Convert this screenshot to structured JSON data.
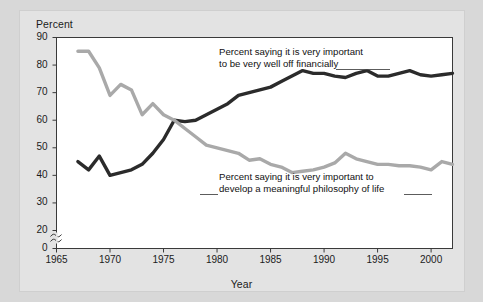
{
  "chart_data": {
    "type": "line",
    "title": "",
    "xlabel": "Year",
    "ylabel": "Percent",
    "xlim": [
      1965,
      2002
    ],
    "ylim": [
      0,
      90
    ],
    "y_axis_break": true,
    "y_break_symbol": "~",
    "grid": true,
    "grid_axis": "y",
    "legend_position": "inline-annotations",
    "x_ticks": [
      1965,
      1970,
      1975,
      1980,
      1985,
      1990,
      1995,
      2000
    ],
    "x_tick_labels": [
      "1965",
      "1970",
      "1975",
      "1980",
      "1985",
      "1990",
      "1995",
      "2000"
    ],
    "y_ticks": [
      0,
      20,
      30,
      40,
      50,
      60,
      70,
      80,
      90
    ],
    "y_tick_labels": [
      "0",
      "20",
      "30",
      "40",
      "50",
      "60",
      "70",
      "80",
      "90"
    ],
    "annotations": [
      {
        "name": "financially-label",
        "line1": "Percent saying it is very important",
        "line2": "to be very well off financially",
        "target_series": "well_off_financially"
      },
      {
        "name": "philosophy-label",
        "line1": "Percent saying it is very important to",
        "line2": "develop a meaningful philosophy of life",
        "target_series": "philosophy_of_life"
      }
    ],
    "series": [
      {
        "name": "well_off_financially",
        "label": "Percent saying it is very important to be very well off financially",
        "color": "#2b2b2b",
        "x": [
          1967,
          1968,
          1969,
          1970,
          1971,
          1972,
          1973,
          1974,
          1975,
          1976,
          1977,
          1978,
          1979,
          1980,
          1981,
          1982,
          1983,
          1984,
          1985,
          1986,
          1987,
          1988,
          1989,
          1990,
          1991,
          1992,
          1993,
          1994,
          1995,
          1996,
          1997,
          1998,
          1999,
          2000,
          2001,
          2002
        ],
        "values": [
          45,
          42,
          47,
          40,
          41,
          42,
          44,
          48,
          53,
          60,
          59.5,
          60,
          62,
          64,
          66,
          69,
          70,
          71,
          72,
          74,
          76,
          78,
          77,
          77,
          76,
          75.5,
          77,
          78,
          76,
          76,
          77,
          78,
          76.5,
          76,
          76.5,
          77
        ]
      },
      {
        "name": "philosophy_of_life",
        "label": "Percent saying it is very important to develop a meaningful philosophy of life",
        "color": "#a9a9a9",
        "x": [
          1967,
          1968,
          1969,
          1970,
          1971,
          1972,
          1973,
          1974,
          1975,
          1976,
          1977,
          1978,
          1979,
          1980,
          1981,
          1982,
          1983,
          1984,
          1985,
          1986,
          1987,
          1988,
          1989,
          1990,
          1991,
          1992,
          1993,
          1994,
          1995,
          1996,
          1997,
          1998,
          1999,
          2000,
          2001,
          2002
        ],
        "values": [
          85,
          85,
          79,
          69,
          73,
          71,
          62,
          66,
          62,
          60,
          57,
          54,
          51,
          50,
          49,
          48,
          45.5,
          46,
          44,
          43,
          41,
          41.5,
          42,
          43,
          44.5,
          48,
          46,
          45,
          44,
          44,
          43.5,
          43.5,
          43,
          42,
          45,
          44
        ]
      }
    ]
  },
  "labels": {
    "y_axis_title": "Percent",
    "x_axis_title": "Year"
  }
}
